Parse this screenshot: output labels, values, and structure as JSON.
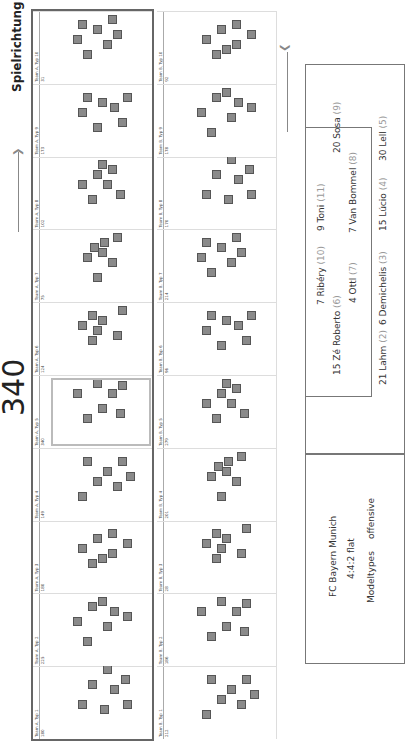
{
  "direction_label": "Spielrichtung",
  "highlight_count": "340",
  "teams": [
    {
      "name": "Team A",
      "types": [
        {
          "label": "Team A, Typ 1",
          "count": "180"
        },
        {
          "label": "Team A, Typ 2",
          "count": "225"
        },
        {
          "label": "Team A, Typ 3",
          "count": "180"
        },
        {
          "label": "Team A, Typ 4",
          "count": "149"
        },
        {
          "label": "Team A, Typ 5",
          "count": "340"
        },
        {
          "label": "Team A, Typ 6",
          "count": "124"
        },
        {
          "label": "Team A, Typ 7",
          "count": "75"
        },
        {
          "label": "Team A, Typ 8",
          "count": "102"
        },
        {
          "label": "Team A, Typ 9",
          "count": "173"
        },
        {
          "label": "Team A, Typ 10",
          "count": "31"
        }
      ]
    },
    {
      "name": "Team B",
      "types": [
        {
          "label": "Team B, Typ 1",
          "count": "212"
        },
        {
          "label": "Team B, Typ 2",
          "count": "186"
        },
        {
          "label": "Team B, Typ 3",
          "count": "28"
        },
        {
          "label": "Team B, Typ 4",
          "count": "201"
        },
        {
          "label": "Team B, Typ 5",
          "count": "279"
        },
        {
          "label": "Team B, Typ 6",
          "count": "96"
        },
        {
          "label": "Team B, Typ 7",
          "count": "214"
        },
        {
          "label": "Team B, Typ 8",
          "count": "170"
        },
        {
          "label": "Team B, Typ 9",
          "count": "178"
        },
        {
          "label": "Team B, Typ 10",
          "count": "92"
        }
      ]
    }
  ],
  "info": {
    "team": "FC Bayern Munich",
    "formation": "4:4:2 flat",
    "modeltypes_label": "Modeltypes",
    "modeltypes_value": "offensive"
  },
  "lineup": [
    {
      "name": "7 Ribéry",
      "num": "(10)"
    },
    {
      "name": "9 Toni",
      "num": "(11)"
    },
    {
      "name": "15 Zé Roberto",
      "num": "(6)"
    },
    {
      "name": "20 Sosa",
      "num": "(9)"
    },
    {
      "name": "4 Ottl",
      "num": "(7)"
    },
    {
      "name": "7 Van Bommel",
      "num": "(8)"
    },
    {
      "name": "21 Lahm",
      "num": "(2)"
    },
    {
      "name": "6 Demichelis",
      "num": "(3)"
    },
    {
      "name": "15 Lúcio",
      "num": "(4)"
    },
    {
      "name": "30 Lell",
      "num": "(5)"
    }
  ],
  "colors": {
    "player": "#8a8a8a",
    "frame": "#666666",
    "highlight": "#bbbbbb"
  }
}
